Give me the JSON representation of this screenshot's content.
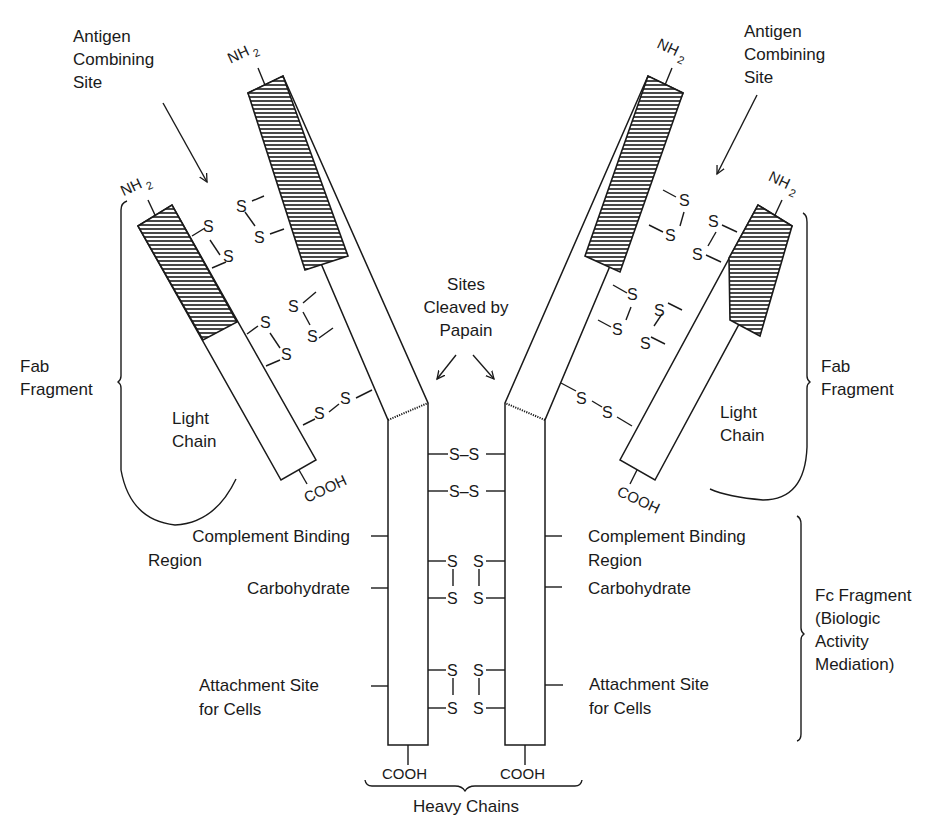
{
  "diagram": {
    "labels": {
      "antigen_site_left": [
        "Antigen",
        "Combining",
        "Site"
      ],
      "antigen_site_right": [
        "Antigen",
        "Combining",
        "Site"
      ],
      "papain": [
        "Sites",
        "Cleaved by",
        "Papain"
      ],
      "fab_left": [
        "Fab",
        "Fragment"
      ],
      "fab_right": [
        "Fab",
        "Fragment"
      ],
      "light_chain_left": [
        "Light",
        "Chain"
      ],
      "light_chain_right": [
        "Light",
        "Chain"
      ],
      "complement_left": [
        "Complement Binding",
        "Region"
      ],
      "complement_right": [
        "Complement Binding",
        "Region"
      ],
      "carbohydrate_left": "Carbohydrate",
      "carbohydrate_right": "Carbohydrate",
      "attachment_left": [
        "Attachment Site",
        "for Cells"
      ],
      "attachment_right": [
        "Attachment Site",
        "for Cells"
      ],
      "fc_fragment": [
        "Fc Fragment",
        "(Biologic",
        "Activity",
        "Mediation)"
      ],
      "heavy_chains": "Heavy Chains"
    },
    "chem": {
      "nh": "NH",
      "sub2": "2",
      "cooh": "COOH",
      "s": "S",
      "ss": "S–S"
    }
  }
}
